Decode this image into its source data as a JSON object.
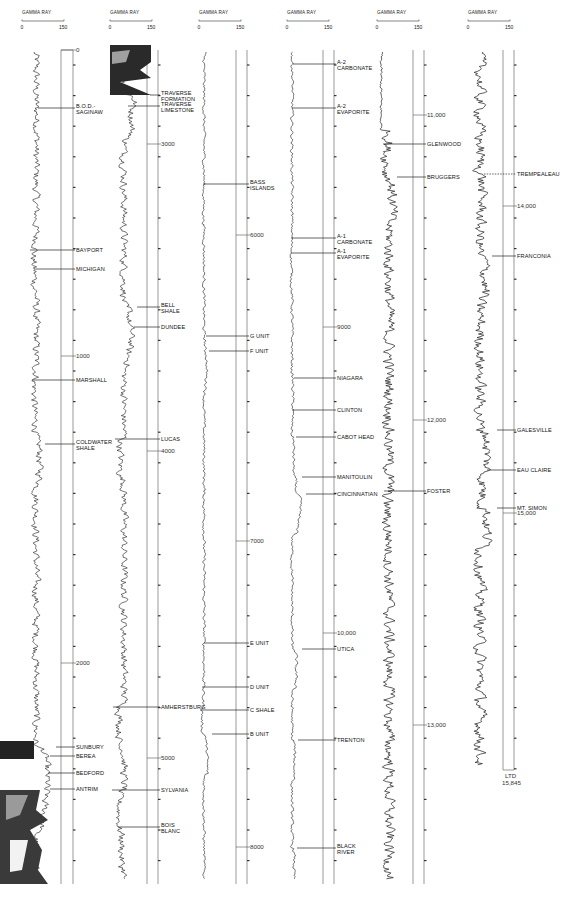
{
  "chart_data": {
    "type": "line",
    "track_header": {
      "label": "GAMMA RAY",
      "scale_min": 0,
      "scale_max": 150,
      "unit": "API"
    },
    "total_depth_label": [
      "LTD",
      "15,845"
    ],
    "panels": [
      {
        "name": "panel-1",
        "x": 22,
        "curve_w": 42,
        "lane_x": 61,
        "scale_x": 73,
        "top_y": 50,
        "bottom_y": 884,
        "depth_top": 0,
        "depth_bottom": 2500,
        "depth_labels": [
          {
            "text": "0",
            "y": 50
          },
          {
            "text": "1000",
            "y": 356
          },
          {
            "text": "2000",
            "y": 663
          }
        ],
        "formations": [
          {
            "name": [
              "B.O.D.-",
              "SAGINAW"
            ],
            "y": 108,
            "curve_x": 38
          },
          {
            "name": [
              "BAYPORT"
            ],
            "y": 250,
            "curve_x": 30
          },
          {
            "name": [
              "MICHIGAN"
            ],
            "y": 269,
            "curve_x": 36
          },
          {
            "name": [
              "MARSHALL"
            ],
            "y": 380,
            "curve_x": 32
          },
          {
            "name": [
              "COLDWATER",
              "SHALE"
            ],
            "y": 444,
            "curve_x": 45
          },
          {
            "name": [
              "SUNBURY"
            ],
            "y": 747,
            "curve_x": 56
          },
          {
            "name": [
              "BEREA"
            ],
            "y": 756,
            "curve_x": 50
          },
          {
            "name": [
              "BEDFORD"
            ],
            "y": 773,
            "curve_x": 48
          },
          {
            "name": [
              "ANTRIM"
            ],
            "y": 789,
            "curve_x": 50
          }
        ],
        "style": "mixed"
      },
      {
        "name": "panel-2",
        "x": 110,
        "curve_w": 42,
        "lane_x": 147,
        "scale_x": 158,
        "top_y": 50,
        "bottom_y": 884,
        "depth_top": 2500,
        "depth_bottom": 5100,
        "depth_labels": [
          {
            "text": "3000",
            "y": 144
          },
          {
            "text": "4000",
            "y": 451
          },
          {
            "text": "5000",
            "y": 758
          }
        ],
        "formations": [
          {
            "name": [
              "TRAVERSE",
              "FORMATION"
            ],
            "y": 95,
            "curve_x": 150
          },
          {
            "name": [
              "TRAVERSE",
              "LIMESTONE"
            ],
            "y": 106,
            "curve_x": 128
          },
          {
            "name": [
              "BELL",
              "SHALE"
            ],
            "y": 307,
            "curve_x": 137
          },
          {
            "name": [
              "DUNDEE"
            ],
            "y": 327,
            "curve_x": 134
          },
          {
            "name": [
              "LUCAS"
            ],
            "y": 439,
            "curve_x": 115
          },
          {
            "name": [
              "AMHERSTBURG"
            ],
            "y": 707,
            "curve_x": 113
          },
          {
            "name": [
              "SYLVANIA"
            ],
            "y": 790,
            "curve_x": 112
          },
          {
            "name": [
              "BOIS",
              "BLANC"
            ],
            "y": 827,
            "curve_x": 118
          }
        ],
        "style": "mixed2"
      },
      {
        "name": "panel-3",
        "x": 199,
        "curve_w": 42,
        "lane_x": 236,
        "scale_x": 247,
        "top_y": 50,
        "bottom_y": 884,
        "depth_top": 5100,
        "depth_bottom": 8300,
        "depth_labels": [
          {
            "text": "6000",
            "y": 235
          },
          {
            "text": "7000",
            "y": 541
          },
          {
            "text": "8000",
            "y": 847
          }
        ],
        "formations": [
          {
            "name": [
              "BASS",
              "ISLANDS"
            ],
            "y": 184,
            "curve_x": 203
          },
          {
            "name": [
              "G UNIT"
            ],
            "y": 336,
            "curve_x": 206
          },
          {
            "name": [
              "F UNIT"
            ],
            "y": 351,
            "curve_x": 209
          },
          {
            "name": [
              "E UNIT"
            ],
            "y": 643,
            "curve_x": 204
          },
          {
            "name": [
              "D UNIT"
            ],
            "y": 687,
            "curve_x": 202
          },
          {
            "name": [
              "C SHALE"
            ],
            "y": 710,
            "curve_x": 200
          },
          {
            "name": [
              "B UNIT"
            ],
            "y": 734,
            "curve_x": 212
          }
        ],
        "style": "quiet"
      },
      {
        "name": "panel-4",
        "x": 287,
        "curve_w": 42,
        "lane_x": 323,
        "scale_x": 334,
        "top_y": 50,
        "bottom_y": 884,
        "depth_top": 8300,
        "depth_bottom": 11000,
        "depth_labels": [
          {
            "text": "9000",
            "y": 327
          },
          {
            "text": "10,000",
            "y": 633
          }
        ],
        "formations": [
          {
            "name": [
              "A-2",
              "CARBONATE"
            ],
            "y": 64,
            "curve_x": 293
          },
          {
            "name": [
              "A-2",
              "EVAPORITE"
            ],
            "y": 108,
            "curve_x": 292
          },
          {
            "name": [
              "A-1",
              "CARBONATE"
            ],
            "y": 238,
            "curve_x": 291
          },
          {
            "name": [
              "A-1",
              "EVAPORITE"
            ],
            "y": 253,
            "curve_x": 291
          },
          {
            "name": [
              "NIAGARA"
            ],
            "y": 378,
            "curve_x": 294
          },
          {
            "name": [
              "CLINTON"
            ],
            "y": 410,
            "curve_x": 292
          },
          {
            "name": [
              "CABOT HEAD"
            ],
            "y": 437,
            "curve_x": 296
          },
          {
            "name": [
              "MANITOULIN"
            ],
            "y": 477,
            "curve_x": 302
          },
          {
            "name": [
              "CINCINNATIAN"
            ],
            "y": 494,
            "curve_x": 306
          },
          {
            "name": [
              "UTICA"
            ],
            "y": 649,
            "curve_x": 302
          },
          {
            "name": [
              "TRENTON"
            ],
            "y": 740,
            "curve_x": 298
          },
          {
            "name": [
              "BLACK",
              "RIVER"
            ],
            "y": 848,
            "curve_x": 297
          }
        ],
        "style": "quiet2"
      },
      {
        "name": "panel-5",
        "x": 377,
        "curve_w": 42,
        "lane_x": 413,
        "scale_x": 424,
        "top_y": 50,
        "bottom_y": 884,
        "depth_top": 10700,
        "depth_bottom": 13500,
        "depth_labels": [
          {
            "text": "11,000",
            "y": 115
          },
          {
            "text": "12,000",
            "y": 420
          },
          {
            "text": "13,000",
            "y": 725
          }
        ],
        "formations": [
          {
            "name": [
              "GLENWOOD"
            ],
            "y": 144,
            "curve_x": 383
          },
          {
            "name": [
              "BRUGGERS"
            ],
            "y": 177,
            "curve_x": 397
          },
          {
            "name": [
              "FOSTER"
            ],
            "y": 491,
            "curve_x": 384
          }
        ],
        "style": "noisy"
      },
      {
        "name": "panel-6",
        "x": 468,
        "curve_w": 42,
        "lane_x": 503,
        "scale_x": 514,
        "top_y": 50,
        "bottom_y": 770,
        "depth_top": 13600,
        "depth_bottom": 15845,
        "depth_labels": [
          {
            "text": "14,000",
            "y": 206
          },
          {
            "text": "15,000",
            "y": 513
          }
        ],
        "formations": [
          {
            "name": [
              "TREMPEALEAU"
            ],
            "y": 174,
            "curve_x": 484,
            "dashed": true
          },
          {
            "name": [
              "FRANCONIA"
            ],
            "y": 256,
            "curve_x": 492
          },
          {
            "name": [
              "GALESVILLE"
            ],
            "y": 430,
            "curve_x": 497
          },
          {
            "name": [
              "EAU CLAIRE"
            ],
            "y": 470,
            "curve_x": 487
          },
          {
            "name": [
              "MT. SIMON"
            ],
            "y": 508,
            "curve_x": 497
          }
        ],
        "style": "noisy2"
      }
    ],
    "xlabel": "GAMMA RAY (0–150)",
    "ylabel": "Depth (ft)",
    "ylim": [
      0,
      15845
    ],
    "grid": false,
    "legend": "none"
  }
}
